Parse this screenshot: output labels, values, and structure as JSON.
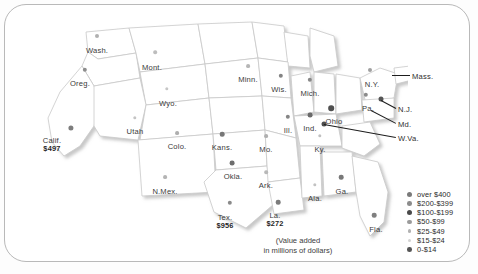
{
  "figure": {
    "caption_line1": "(Value added",
    "caption_line2": "in millions of dollars)"
  },
  "chart_data": {
    "type": "map",
    "title": "",
    "units": "millions of dollars (value added)",
    "region": "United States",
    "legend_title": "",
    "legend": [
      {
        "label": "over $400",
        "dot_px": 5.2,
        "color": "#7a7a7a"
      },
      {
        "label": "$200-$399",
        "dot_px": 4.6,
        "color": "#8c8c8c"
      },
      {
        "label": "$100-$199",
        "dot_px": 5.0,
        "color": "#4a4a4a"
      },
      {
        "label": "$50-$99",
        "dot_px": 4.2,
        "color": "#9b9b9b"
      },
      {
        "label": "$25-$49",
        "dot_px": 3.8,
        "color": "#b2b2b2"
      },
      {
        "label": "$15-$24",
        "dot_px": 3.2,
        "color": "#d2d2d2"
      },
      {
        "label": "0-$14",
        "dot_px": 4.6,
        "color": "#555555"
      }
    ],
    "states": [
      {
        "name": "Wash.",
        "value": null,
        "label_x": 97,
        "label_y": 47,
        "dot_x": 97,
        "dot_y": 36,
        "dot_px": 4.0,
        "color": "#b0b0b0"
      },
      {
        "name": "Oreg.",
        "value": null,
        "label_x": 80,
        "label_y": 80,
        "dot_x": 85,
        "dot_y": 70,
        "dot_px": 4.4,
        "color": "#8d8d8d"
      },
      {
        "name": "Calif.",
        "value": "$497",
        "label_x": 52,
        "label_y": 137,
        "dot_x": 71,
        "dot_y": 128,
        "dot_px": 5.2,
        "color": "#7d7d7d"
      },
      {
        "name": "Mont.",
        "value": null,
        "label_x": 152,
        "label_y": 64,
        "dot_x": 155,
        "dot_y": 52,
        "dot_px": 3.6,
        "color": "#bdbdbd"
      },
      {
        "name": "Wyo.",
        "value": null,
        "label_x": 168,
        "label_y": 100,
        "dot_x": 167,
        "dot_y": 89,
        "dot_px": 3.4,
        "color": "#c6c6c6"
      },
      {
        "name": "Utah",
        "value": null,
        "label_x": 135,
        "label_y": 128,
        "dot_x": 135,
        "dot_y": 118,
        "dot_px": 3.4,
        "color": "#c4c4c4"
      },
      {
        "name": "Colo.",
        "value": null,
        "label_x": 177,
        "label_y": 143,
        "dot_x": 177,
        "dot_y": 133,
        "dot_px": 3.8,
        "color": "#aeaeae"
      },
      {
        "name": "N.Mex.",
        "value": null,
        "label_x": 165,
        "label_y": 188,
        "dot_x": 165,
        "dot_y": 177,
        "dot_px": 3.8,
        "color": "#b4b4b4"
      },
      {
        "name": "Kans.",
        "value": null,
        "label_x": 222,
        "label_y": 144,
        "dot_x": 222,
        "dot_y": 134,
        "dot_px": 4.6,
        "color": "#777777"
      },
      {
        "name": "Okla.",
        "value": null,
        "label_x": 233,
        "label_y": 173,
        "dot_x": 232,
        "dot_y": 163,
        "dot_px": 4.8,
        "color": "#6e6e6e"
      },
      {
        "name": "Tex.",
        "value": "$956",
        "label_x": 225,
        "label_y": 214,
        "dot_x": 230,
        "dot_y": 203,
        "dot_px": 4.4,
        "color": "#8a8a8a"
      },
      {
        "name": "Minn.",
        "value": null,
        "label_x": 248,
        "label_y": 76,
        "dot_x": 248,
        "dot_y": 66,
        "dot_px": 3.8,
        "color": "#b6b6b6"
      },
      {
        "name": "Wis.",
        "value": null,
        "label_x": 279,
        "label_y": 86,
        "dot_x": 281,
        "dot_y": 76,
        "dot_px": 4.4,
        "color": "#838383"
      },
      {
        "name": "Mich.",
        "value": null,
        "label_x": 310,
        "label_y": 90,
        "dot_x": 310,
        "dot_y": 80,
        "dot_px": 4.4,
        "color": "#888888"
      },
      {
        "name": "Mo.",
        "value": null,
        "label_x": 266,
        "label_y": 146,
        "dot_x": 266,
        "dot_y": 136,
        "dot_px": 3.8,
        "color": "#b0b0b0"
      },
      {
        "name": "Ill.",
        "value": null,
        "label_x": 288,
        "label_y": 127,
        "dot_x": 288,
        "dot_y": 117,
        "dot_px": 4.4,
        "color": "#858585"
      },
      {
        "name": "Ind.",
        "value": null,
        "label_x": 310,
        "label_y": 125,
        "dot_x": 310,
        "dot_y": 115,
        "dot_px": 4.8,
        "color": "#6a6a6a"
      },
      {
        "name": "Ohio",
        "value": null,
        "label_x": 334,
        "label_y": 118,
        "dot_x": 331,
        "dot_y": 108,
        "dot_px": 5.6,
        "color": "#4f4f4f"
      },
      {
        "name": "Ky.",
        "value": null,
        "label_x": 320,
        "label_y": 146,
        "dot_x": 320,
        "dot_y": 136,
        "dot_px": 3.4,
        "color": "#c0c0c0"
      },
      {
        "name": "Ark.",
        "value": null,
        "label_x": 266,
        "label_y": 182,
        "dot_x": 266,
        "dot_y": 172,
        "dot_px": 3.6,
        "color": "#b8b8b8"
      },
      {
        "name": "La.",
        "value": "$272",
        "label_x": 275,
        "label_y": 212,
        "dot_x": 278,
        "dot_y": 202,
        "dot_px": 4.6,
        "color": "#7b7b7b"
      },
      {
        "name": "Ala.",
        "value": null,
        "label_x": 315,
        "label_y": 195,
        "dot_x": 315,
        "dot_y": 185,
        "dot_px": 3.4,
        "color": "#c2c2c2"
      },
      {
        "name": "Ga.",
        "value": null,
        "label_x": 342,
        "label_y": 188,
        "dot_x": 341,
        "dot_y": 177,
        "dot_px": 4.6,
        "color": "#787878"
      },
      {
        "name": "Fla.",
        "value": null,
        "label_x": 376,
        "label_y": 226,
        "dot_x": 374,
        "dot_y": 215,
        "dot_px": 4.6,
        "color": "#7f7f7f"
      },
      {
        "name": "N.Y.",
        "value": null,
        "label_x": 372,
        "label_y": 81,
        "dot_x": 370,
        "dot_y": 70,
        "dot_px": 4.0,
        "color": "#a0a0a0"
      },
      {
        "name": "Pa.",
        "value": null,
        "label_x": 368,
        "label_y": 105,
        "dot_x": 366,
        "dot_y": 95,
        "dot_px": 4.4,
        "color": "#8b8b8b"
      }
    ],
    "callouts": [
      {
        "label": "Mass.",
        "label_x": 412,
        "label_y": 72,
        "line_x1": 392,
        "line_y1": 75,
        "line_x2": 410,
        "line_y2": 75
      },
      {
        "label": "N.J.",
        "label_x": 398,
        "label_y": 105,
        "line_x1": 381,
        "line_y1": 100,
        "line_x2": 396,
        "line_y2": 108
      },
      {
        "label": "Md.",
        "label_x": 398,
        "label_y": 120,
        "line_x1": 371,
        "line_y1": 110,
        "line_x2": 396,
        "line_y2": 123
      },
      {
        "label": "W.Va.",
        "label_x": 398,
        "label_y": 134,
        "line_x1": 324,
        "line_y1": 124,
        "line_x2": 396,
        "line_y2": 137
      }
    ],
    "callout_dots": [
      {
        "name": "N.J.-dot",
        "dot_x": 381,
        "dot_y": 99,
        "dot_px": 5.0,
        "color": "#555555"
      },
      {
        "name": "W.Va.-dot",
        "dot_x": 324,
        "dot_y": 124,
        "dot_px": 5.0,
        "color": "#4d4d4d"
      }
    ]
  }
}
